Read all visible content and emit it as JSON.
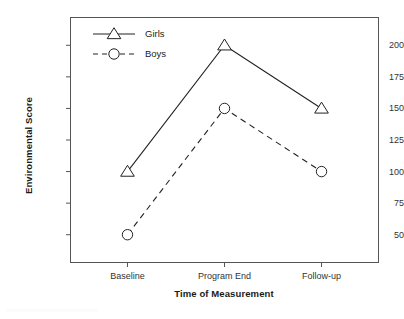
{
  "chart_data": {
    "type": "line",
    "title": "",
    "xlabel": "Time of Measurement",
    "ylabel": "Environmental Score",
    "categories": [
      "Baseline",
      "Program End",
      "Follow-up"
    ],
    "series": [
      {
        "name": "Girls",
        "values": [
          100,
          200,
          150
        ],
        "marker": "triangle-open",
        "linestyle": "solid",
        "color": "#222222"
      },
      {
        "name": "Boys",
        "values": [
          50,
          150,
          100
        ],
        "marker": "circle-open",
        "linestyle": "dashed",
        "color": "#222222"
      }
    ],
    "yticks": [
      50,
      75,
      100,
      125,
      150,
      175,
      200
    ],
    "ytick_labels": [
      "50",
      "75",
      "100",
      "125",
      "150",
      "175",
      "200"
    ],
    "ylim": [
      28,
      222
    ],
    "grid": false,
    "legend_position": "upper-left-inside",
    "frame": "box"
  },
  "axis": {
    "y_title": "Environmental Score",
    "x_title": "Time of Measurement"
  },
  "legend": {
    "entries": [
      {
        "label": "Girls"
      },
      {
        "label": "Boys"
      }
    ]
  }
}
